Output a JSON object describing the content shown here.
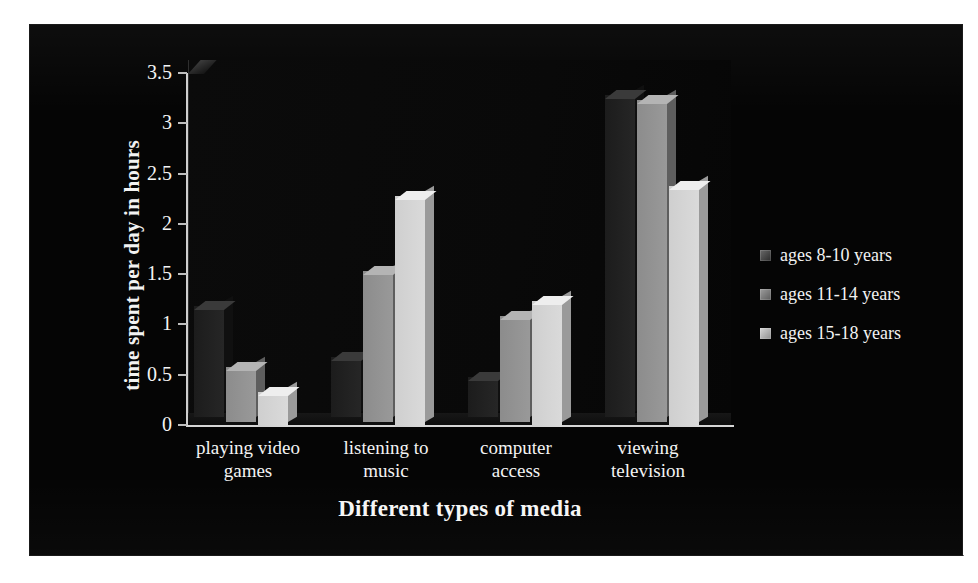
{
  "chart_data": {
    "type": "bar",
    "title": "",
    "xlabel": "Different types of media",
    "ylabel": "time spent per day in hours",
    "ylim": [
      0,
      3.5
    ],
    "yticks": [
      "0",
      "0.5",
      "1",
      "1.5",
      "2",
      "2.5",
      "3",
      "3.5"
    ],
    "ytick_values": [
      0,
      0.5,
      1,
      1.5,
      2,
      2.5,
      3,
      3.5
    ],
    "grid": false,
    "legend_position": "right",
    "categories": [
      "playing video games",
      "listening to music",
      "computer access",
      "viewing television"
    ],
    "series": [
      {
        "name": "ages 8-10 years",
        "color": "#262626",
        "values": [
          1.1,
          0.6,
          0.4,
          3.2
        ]
      },
      {
        "name": "ages 11-14 years",
        "color": "#999999",
        "values": [
          0.55,
          1.5,
          1.05,
          3.2
        ]
      },
      {
        "name": "ages 15-18 years",
        "color": "#dadada",
        "values": [
          0.35,
          2.3,
          1.25,
          2.4
        ]
      }
    ]
  },
  "legend": {
    "items": [
      {
        "label": "ages 8-10 years"
      },
      {
        "label": "ages 11-14 years"
      },
      {
        "label": "ages 15-18 years"
      }
    ]
  },
  "axes": {
    "y_title": "time spent per day in hours",
    "x_title": "Different types of media"
  },
  "colors": {
    "background": "#050505",
    "text": "#f4f4f4",
    "axis": "#cfcfcf",
    "series_dark": "#262626",
    "series_mid": "#999999",
    "series_light": "#dadada"
  }
}
